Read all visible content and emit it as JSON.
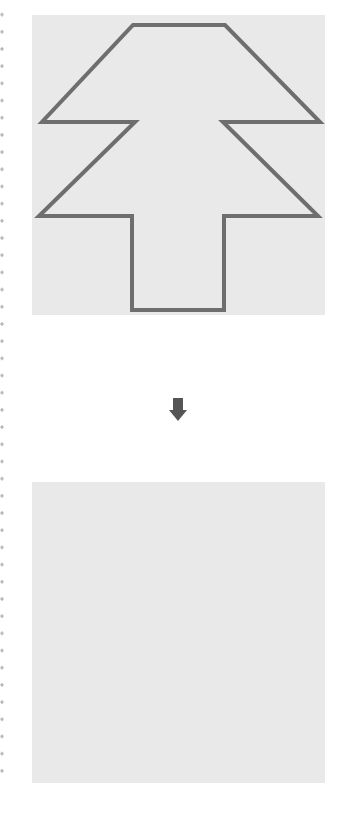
{
  "diagram": {
    "colors": {
      "panel_fill": "#e9e9e9",
      "shape_stroke": "#6e6e6e",
      "arrow": "#555555",
      "dots": "#b8b8b8"
    },
    "top_panel": {
      "shape": "tree-outline",
      "points": "101,10 193,10 288,107 191,107 286,201 192,201 192,295 100,295 100,201 7,201 103,107 10,107"
    },
    "bottom_panel": {
      "shape": "empty"
    },
    "arrow": {
      "direction": "down",
      "icon": "down-arrow-icon"
    }
  }
}
